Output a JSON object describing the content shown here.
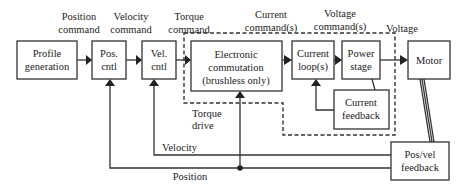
{
  "diagram": {
    "type": "block-diagram",
    "blocks": {
      "profile": {
        "line1": "Profile",
        "line2": "generation"
      },
      "pos_cntl": {
        "line1": "Pos.",
        "line2": "cntl"
      },
      "vel_cntl": {
        "line1": "Vel.",
        "line2": "cntl"
      },
      "commutation": {
        "line1": "Electronic",
        "line2": "commutation",
        "line3": "(brushless only)"
      },
      "current_loop": {
        "line1": "Current",
        "line2": "loop(s)"
      },
      "power_stage": {
        "line1": "Power",
        "line2": "stage"
      },
      "motor": {
        "line1": "Motor"
      },
      "current_feedback": {
        "line1": "Current",
        "line2": "feedback"
      },
      "posvel_feedback": {
        "line1": "Pos/vel",
        "line2": "feedback"
      }
    },
    "signals": {
      "position_command": {
        "line1": "Position",
        "line2": "command"
      },
      "velocity_command": {
        "line1": "Velocity",
        "line2": "command"
      },
      "torque_command": {
        "line1": "Torque",
        "line2": "command"
      },
      "current_commands": {
        "line1": "Current",
        "line2": "command(s)"
      },
      "voltage_commands": {
        "line1": "Voltage",
        "line2": "command(s)"
      },
      "voltage": {
        "line1": "Voltage"
      },
      "velocity": {
        "line1": "Velocity"
      },
      "position": {
        "line1": "Position"
      }
    },
    "regions": {
      "torque_drive": {
        "line1": "Torque",
        "line2": "drive"
      }
    }
  }
}
